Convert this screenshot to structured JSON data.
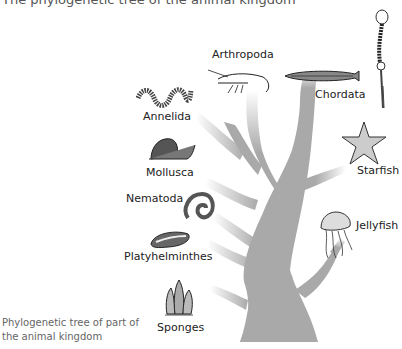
{
  "header": {
    "text": "The phylogenetic tree of the animal kingdom"
  },
  "caption": {
    "line1": "Phylogenetic tree of part of",
    "line2": "the animal kingdom"
  },
  "colors": {
    "trunk": "#a9a9a9",
    "text": "#222222",
    "caption": "#666666"
  },
  "labels": {
    "arthropoda": "Arthropoda",
    "chordata": "Chordata",
    "annelida": "Annelida",
    "mollusca": "Mollusca",
    "starfish": "Starfish",
    "nematoda": "Nematoda",
    "jellyfish": "Jellyfish",
    "platyhelminthes": "Platyhelminthes",
    "sponges": "Sponges"
  }
}
